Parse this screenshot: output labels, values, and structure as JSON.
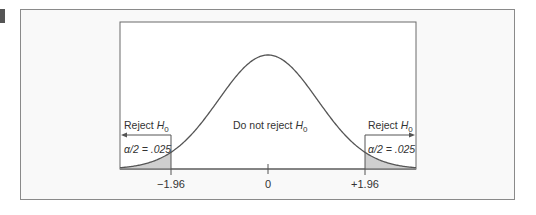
{
  "chart_data": {
    "type": "area",
    "title": "",
    "xlabel": "",
    "ylabel": "",
    "x_ticks": [
      {
        "value": -1.96,
        "label": "−1.96"
      },
      {
        "value": 0,
        "label": "0"
      },
      {
        "value": 1.96,
        "label": "+1.96"
      }
    ],
    "xlim": [
      -3.0,
      3.0
    ],
    "grid": false,
    "curve": "standard normal density",
    "regions": [
      {
        "name": "left-rejection",
        "from": -3.0,
        "to": -1.96,
        "label": "Reject H0",
        "area_label": "α/2 = .025",
        "shaded": true
      },
      {
        "name": "non-rejection",
        "from": -1.96,
        "to": 1.96,
        "label": "Do not reject H0",
        "shaded": false
      },
      {
        "name": "right-rejection",
        "from": 1.96,
        "to": 3.0,
        "label": "Reject H0",
        "area_label": "α/2 = .025",
        "shaded": true
      }
    ],
    "alpha": 0.05,
    "colors": {
      "curve": "#555555",
      "shade": "#cfcfcf",
      "frame": "#6a6a6a"
    }
  },
  "labels": {
    "reject_left": "Reject ",
    "reject_right": "Reject ",
    "do_not_reject": "Do not reject ",
    "h": "H",
    "sub0": "0",
    "alpha_left": "α/2 = .025",
    "alpha_right": "α/2 = .025",
    "tick_neg": "−1.96",
    "tick_zero": "0",
    "tick_pos": "+1.96"
  }
}
